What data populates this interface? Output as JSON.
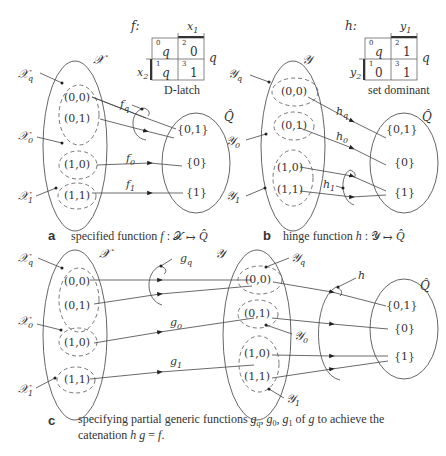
{
  "kmaps": {
    "f": {
      "name": "f:",
      "col_var": "x1",
      "row_var": "x2",
      "out_var": "q",
      "cells": [
        {
          "index": "0",
          "value": "q"
        },
        {
          "index": "2",
          "value": "0"
        },
        {
          "index": "1",
          "value": "q"
        },
        {
          "index": "3",
          "value": "1"
        }
      ],
      "caption": "D-latch"
    },
    "h": {
      "name": "h:",
      "col_var": "y1",
      "row_var": "y2",
      "out_var": "q",
      "cells": [
        {
          "index": "0",
          "value": "q"
        },
        {
          "index": "2",
          "value": "1"
        },
        {
          "index": "1",
          "value": "0"
        },
        {
          "index": "3",
          "value": "1"
        }
      ],
      "caption": "set dominant"
    }
  },
  "panel_a": {
    "set_label": "𝒳",
    "subsets": [
      "𝒳q",
      "𝒳0",
      "𝒳1"
    ],
    "elements": [
      "(0,0)",
      "(0,1)",
      "(1,0)",
      "(1,1)"
    ],
    "functions": [
      "fq",
      "f0",
      "f1"
    ],
    "target_label": "Q̂",
    "targets": [
      "{0,1}",
      "{0}",
      "{1}"
    ],
    "letter": "a",
    "caption": "specified function f: 𝒳 ↦ Q̂"
  },
  "panel_b": {
    "set_label": "𝒴",
    "subsets": [
      "𝒴q",
      "𝒴0",
      "𝒴1"
    ],
    "elements": [
      "(0,0)",
      "(0,1)",
      "(1,0)",
      "(1,1)"
    ],
    "functions": [
      "hq",
      "h0",
      "h1"
    ],
    "target_label": "Q̂",
    "targets": [
      "{0,1}",
      "{0}",
      "{1}"
    ],
    "letter": "b",
    "caption": "hinge function h: 𝒴 ↦ Q̂"
  },
  "panel_c": {
    "x_set_label": "𝒳",
    "y_set_label": "𝒴",
    "x_subsets": [
      "𝒳q",
      "𝒳0",
      "𝒳1"
    ],
    "y_subsets": [
      "𝒴q",
      "𝒴0",
      "𝒴1"
    ],
    "elements": [
      "(0,0)",
      "(0,1)",
      "(1,0)",
      "(1,1)"
    ],
    "g_functions": [
      "gq",
      "g0",
      "g1"
    ],
    "h_label": "h",
    "target_label": "Q̂",
    "targets": [
      "{0,1}",
      "{0}",
      "{1}"
    ],
    "letter": "c",
    "caption_line1": "specifying partial generic functions gq, g0, g1 of g to achieve the",
    "caption_line2": "catenation h g = f."
  }
}
